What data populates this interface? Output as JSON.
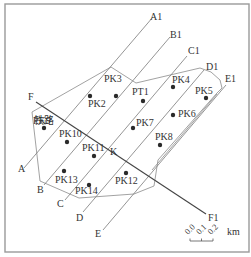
{
  "diagram": {
    "type": "geological survey layout map",
    "frame_color": "#9a9a9a",
    "survey_lines": [
      {
        "start_label": "A",
        "end_label": "A1"
      },
      {
        "start_label": "B",
        "end_label": "B1"
      },
      {
        "start_label": "C",
        "end_label": "C1"
      },
      {
        "start_label": "D",
        "end_label": "D1"
      },
      {
        "start_label": "E",
        "end_label": "E1"
      }
    ],
    "fault": {
      "start_label": "F",
      "end_label": "F1"
    },
    "railway_label": "铁路",
    "intersection_label": "K",
    "points": [
      {
        "label": "PK2"
      },
      {
        "label": "PK3"
      },
      {
        "label": "PT1"
      },
      {
        "label": "PK4"
      },
      {
        "label": "PK5"
      },
      {
        "label": "PK6"
      },
      {
        "label": "PK7"
      },
      {
        "label": "PK8"
      },
      {
        "label": "PK9"
      },
      {
        "label": "PK10"
      },
      {
        "label": "PK11"
      },
      {
        "label": "PK12"
      },
      {
        "label": "PK13"
      },
      {
        "label": "PK14"
      }
    ],
    "scale_bar": {
      "ticks": [
        "0.0",
        "0.1",
        "0.2"
      ],
      "unit": "km"
    }
  }
}
